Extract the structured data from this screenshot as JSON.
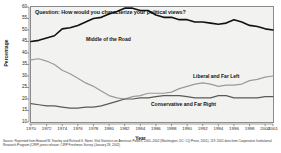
{
  "chart_data": {
    "type": "line",
    "title": "Question: How would you characterize your political views?",
    "xlabel": "Year",
    "ylabel": "Percentage",
    "ylim": [
      10,
      60
    ],
    "xlim": [
      1970,
      2001
    ],
    "grid": false,
    "legend_position": "inline-annotations",
    "ytick_labels": [
      "60",
      "55",
      "50",
      "45",
      "40",
      "35",
      "30",
      "25",
      "20",
      "15",
      "10"
    ],
    "ytick_values": [
      60,
      55,
      50,
      45,
      40,
      35,
      30,
      25,
      20,
      15,
      10
    ],
    "xtick_labels": [
      "1970",
      "1972",
      "1974",
      "1976",
      "1978",
      "1980",
      "1982",
      "1984",
      "1986",
      "1988",
      "1990",
      "1992",
      "1994",
      "1996",
      "1998",
      "2000",
      "2001"
    ],
    "xtick_values": [
      1970,
      1972,
      1974,
      1976,
      1978,
      1980,
      1982,
      1984,
      1986,
      1988,
      1990,
      1992,
      1994,
      1996,
      1998,
      2000,
      2001
    ],
    "x": [
      1970,
      1971,
      1972,
      1973,
      1974,
      1975,
      1976,
      1977,
      1978,
      1979,
      1980,
      1981,
      1982,
      1983,
      1984,
      1985,
      1986,
      1987,
      1988,
      1989,
      1990,
      1991,
      1992,
      1993,
      1994,
      1995,
      1996,
      1997,
      1998,
      1999,
      2000,
      2001
    ],
    "series": [
      {
        "name": "Middle of the Road",
        "color": "#111111",
        "width": 1.6,
        "values": [
          45.0,
          45.5,
          46.5,
          47.5,
          50.5,
          51.0,
          52.0,
          53.5,
          55.0,
          55.5,
          57.0,
          58.0,
          59.5,
          59.5,
          58.5,
          58.5,
          56.5,
          55.5,
          55.5,
          54.5,
          54.5,
          53.5,
          53.5,
          53.0,
          52.5,
          53.0,
          54.5,
          53.5,
          52.0,
          51.5,
          50.5,
          50.0
        ]
      },
      {
        "name": "Liberal and Far Left",
        "color": "#9a9a9a",
        "width": 1.2,
        "values": [
          37.0,
          37.5,
          36.5,
          35.0,
          32.5,
          31.0,
          29.0,
          27.0,
          25.5,
          23.5,
          21.5,
          20.5,
          20.0,
          21.0,
          21.5,
          22.5,
          22.5,
          22.5,
          23.0,
          24.5,
          25.5,
          26.5,
          27.0,
          26.5,
          25.5,
          26.0,
          26.0,
          26.5,
          28.0,
          28.5,
          29.5,
          30.0
        ]
      },
      {
        "name": "Conservative and Far Right",
        "color": "#5a5a5a",
        "width": 1.2,
        "values": [
          18.0,
          17.5,
          17.0,
          17.0,
          16.5,
          16.0,
          16.0,
          16.5,
          16.5,
          17.0,
          18.0,
          19.0,
          20.0,
          20.0,
          20.5,
          20.5,
          21.0,
          21.5,
          21.5,
          21.5,
          21.0,
          20.5,
          20.5,
          20.5,
          21.5,
          21.5,
          20.5,
          20.5,
          20.5,
          20.5,
          21.0,
          21.0
        ]
      }
    ],
    "annotations": [
      {
        "text": "Middle of the Road",
        "series": "Middle of the Road"
      },
      {
        "text": "Liberal and Far Left",
        "series": "Liberal and Far Left"
      },
      {
        "text": "Conservative and Far Right",
        "series": "Conservative and Far Right"
      }
    ],
    "source_note": "Source: Reprinted from Howard W. Stanley and Richard G. Niemi, Vital Statistics on American Politics, 2001–2002 (Washington, DC: CQ Press, 2001), 119. 2001 data from Cooperative Institutional Research Program (CIRP) press release; CIRP Freshman Survey (January 28, 2002)."
  }
}
